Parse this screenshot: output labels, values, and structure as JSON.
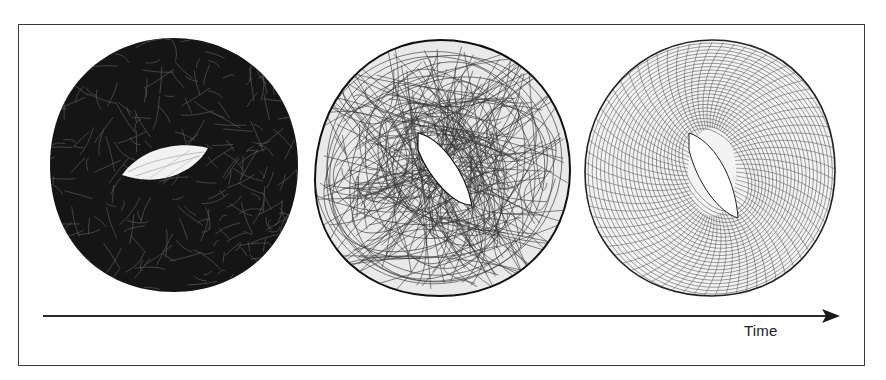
{
  "figure": {
    "panels": [
      {
        "id": "panel-1",
        "style": "dense",
        "label": ""
      },
      {
        "id": "panel-2",
        "style": "chaotic",
        "label": ""
      },
      {
        "id": "panel-3",
        "style": "regular",
        "label": ""
      }
    ],
    "axis": {
      "label": "Time",
      "direction": "left-to-right"
    },
    "colors": {
      "ink": "#111111",
      "frame": "#3a3a3a",
      "background": "#ffffff"
    }
  }
}
